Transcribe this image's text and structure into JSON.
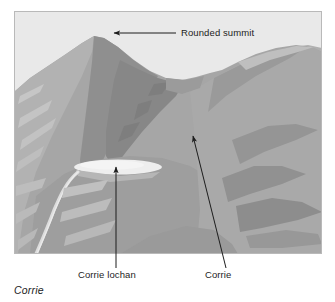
{
  "figure": {
    "caption": "Corrie",
    "frame": {
      "border_color": "#b9b9b9",
      "x": 14,
      "y": 11,
      "width": 308,
      "height": 243
    },
    "palette": {
      "sky": "#e9e9e9",
      "mountain_light": "#b4b4b4",
      "mountain_mid": "#a0a0a0",
      "mountain_dark": "#8e8e8e",
      "mountain_darker": "#848484",
      "highlight": "#c9c9c9",
      "lochan": "#ededed",
      "stream": "#d8d8d8",
      "ink": "#1d1d1d"
    },
    "annotations": [
      {
        "id": "rounded-summit",
        "label": "Rounded summit",
        "arrow": {
          "type": "straight",
          "from": [
            176,
            33
          ],
          "to": [
            112,
            33
          ],
          "head": "to"
        }
      },
      {
        "id": "corrie-lochan",
        "label": "Corrie lochan",
        "arrow": {
          "type": "straight",
          "from": [
            116,
            268
          ],
          "to": [
            116,
            165
          ],
          "head": "to"
        }
      },
      {
        "id": "corrie",
        "label": "Corrie",
        "arrow": {
          "type": "straight",
          "from": [
            226,
            268
          ],
          "to": [
            192,
            134
          ],
          "head": "to"
        }
      }
    ],
    "scene": {
      "description": "Grayscale photograph-style illustration of a glacial corrie in a mountain range",
      "features": [
        "rounded summit peak left of centre",
        "saddle / col between two ridges",
        "secondary ridge rising to the right",
        "corrie basin below the summit",
        "small corrie lochan (tarn) on the basin floor",
        "stream draining from the lochan down the lower-left slope"
      ]
    }
  }
}
